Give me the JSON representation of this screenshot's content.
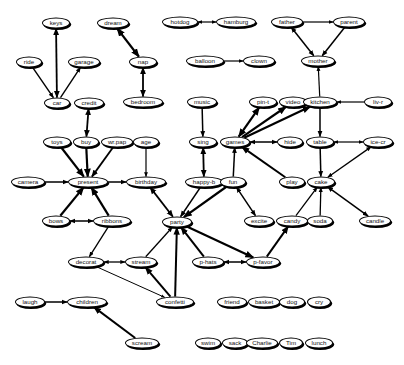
{
  "diagram": {
    "type": "directed-graph",
    "nodes": [
      {
        "id": "keys",
        "label": "keys",
        "x": 56,
        "y": 23,
        "w": 28
      },
      {
        "id": "ride",
        "label": "ride",
        "x": 29,
        "y": 62,
        "w": 26
      },
      {
        "id": "garage",
        "label": "garage",
        "x": 84,
        "y": 62,
        "w": 32
      },
      {
        "id": "car",
        "label": "car",
        "x": 57,
        "y": 103,
        "w": 26
      },
      {
        "id": "credit",
        "label": "credit",
        "x": 89,
        "y": 103,
        "w": 30
      },
      {
        "id": "dream",
        "label": "dream",
        "x": 113,
        "y": 23,
        "w": 32
      },
      {
        "id": "nap",
        "label": "nap",
        "x": 143,
        "y": 62,
        "w": 28
      },
      {
        "id": "bedroom",
        "label": "bedroom",
        "x": 143,
        "y": 102,
        "w": 40
      },
      {
        "id": "hotdog",
        "label": "hotdog",
        "x": 180,
        "y": 22,
        "w": 36
      },
      {
        "id": "hamburg",
        "label": "hamburg",
        "x": 236,
        "y": 22,
        "w": 40
      },
      {
        "id": "balloon",
        "label": "balloon",
        "x": 205,
        "y": 61,
        "w": 38
      },
      {
        "id": "clown",
        "label": "clown",
        "x": 259,
        "y": 61,
        "w": 32
      },
      {
        "id": "father",
        "label": "father",
        "x": 287,
        "y": 22,
        "w": 32
      },
      {
        "id": "parent",
        "label": "parent",
        "x": 349,
        "y": 22,
        "w": 32
      },
      {
        "id": "mother",
        "label": "mother",
        "x": 318,
        "y": 61,
        "w": 34
      },
      {
        "id": "music",
        "label": "music",
        "x": 202,
        "y": 102,
        "w": 30
      },
      {
        "id": "pin-t",
        "label": "pin-t",
        "x": 263,
        "y": 102,
        "w": 28
      },
      {
        "id": "video",
        "label": "video",
        "x": 293,
        "y": 102,
        "w": 28
      },
      {
        "id": "kitchen",
        "label": "kitchen",
        "x": 320,
        "y": 102,
        "w": 34
      },
      {
        "id": "liv-r",
        "label": "liv-r",
        "x": 378,
        "y": 102,
        "w": 28
      },
      {
        "id": "toys",
        "label": "toys",
        "x": 57,
        "y": 142,
        "w": 28
      },
      {
        "id": "buy",
        "label": "buy",
        "x": 86,
        "y": 142,
        "w": 26
      },
      {
        "id": "wr.pap",
        "label": "wr.pap",
        "x": 117,
        "y": 142,
        "w": 32
      },
      {
        "id": "age",
        "label": "age",
        "x": 146,
        "y": 142,
        "w": 26
      },
      {
        "id": "sing",
        "label": "sing",
        "x": 203,
        "y": 142,
        "w": 28
      },
      {
        "id": "games",
        "label": "games",
        "x": 235,
        "y": 142,
        "w": 30
      },
      {
        "id": "hide",
        "label": "hide",
        "x": 290,
        "y": 142,
        "w": 26
      },
      {
        "id": "table",
        "label": "table",
        "x": 320,
        "y": 142,
        "w": 28
      },
      {
        "id": "ice-cr",
        "label": "ice-cr",
        "x": 378,
        "y": 142,
        "w": 30
      },
      {
        "id": "camera",
        "label": "camera",
        "x": 28,
        "y": 182,
        "w": 34
      },
      {
        "id": "present",
        "label": "present",
        "x": 88,
        "y": 182,
        "w": 40
      },
      {
        "id": "birthday",
        "label": "birthday",
        "x": 146,
        "y": 182,
        "w": 40
      },
      {
        "id": "happy-b",
        "label": "happy-b",
        "x": 204,
        "y": 182,
        "w": 38
      },
      {
        "id": "fun",
        "label": "fun",
        "x": 233,
        "y": 182,
        "w": 26
      },
      {
        "id": "play",
        "label": "play",
        "x": 292,
        "y": 182,
        "w": 26
      },
      {
        "id": "cake",
        "label": "cake",
        "x": 321,
        "y": 182,
        "w": 28
      },
      {
        "id": "bows",
        "label": "bows",
        "x": 56,
        "y": 221,
        "w": 28
      },
      {
        "id": "ribbons",
        "label": "ribbons",
        "x": 112,
        "y": 221,
        "w": 38
      },
      {
        "id": "party",
        "label": "party",
        "x": 177,
        "y": 222,
        "w": 30
      },
      {
        "id": "excite",
        "label": "excite",
        "x": 259,
        "y": 221,
        "w": 30
      },
      {
        "id": "candy",
        "label": "candy",
        "x": 292,
        "y": 221,
        "w": 32
      },
      {
        "id": "soda",
        "label": "soda",
        "x": 320,
        "y": 221,
        "w": 26
      },
      {
        "id": "candle",
        "label": "candle",
        "x": 375,
        "y": 221,
        "w": 32
      },
      {
        "id": "decorat",
        "label": "decorat",
        "x": 86,
        "y": 262,
        "w": 36
      },
      {
        "id": "stream",
        "label": "stream",
        "x": 141,
        "y": 262,
        "w": 32
      },
      {
        "id": "p-hats",
        "label": "p-hats",
        "x": 208,
        "y": 262,
        "w": 32
      },
      {
        "id": "p-favor",
        "label": "p-favor",
        "x": 263,
        "y": 262,
        "w": 34
      },
      {
        "id": "laugh",
        "label": "laugh",
        "x": 30,
        "y": 302,
        "w": 30
      },
      {
        "id": "children",
        "label": "children",
        "x": 87,
        "y": 302,
        "w": 40
      },
      {
        "id": "confetti",
        "label": "confetti",
        "x": 175,
        "y": 302,
        "w": 38
      },
      {
        "id": "friend",
        "label": "friend",
        "x": 232,
        "y": 302,
        "w": 30
      },
      {
        "id": "basket",
        "label": "basket",
        "x": 264,
        "y": 302,
        "w": 32
      },
      {
        "id": "dog",
        "label": "dog",
        "x": 292,
        "y": 302,
        "w": 26
      },
      {
        "id": "cry",
        "label": "cry",
        "x": 319,
        "y": 302,
        "w": 24
      },
      {
        "id": "scream",
        "label": "scream",
        "x": 142,
        "y": 343,
        "w": 34
      },
      {
        "id": "swim",
        "label": "swim",
        "x": 208,
        "y": 343,
        "w": 26
      },
      {
        "id": "sack",
        "label": "sack",
        "x": 235,
        "y": 343,
        "w": 26
      },
      {
        "id": "Charlie",
        "label": "Charlie",
        "x": 262,
        "y": 343,
        "w": 32
      },
      {
        "id": "Tim",
        "label": "Tim",
        "x": 291,
        "y": 343,
        "w": 24
      },
      {
        "id": "lunch",
        "label": "lunch",
        "x": 319,
        "y": 343,
        "w": 28
      }
    ],
    "edges": [
      {
        "from": "keys",
        "to": "car",
        "bidir": true,
        "w": 1.8
      },
      {
        "from": "ride",
        "to": "car",
        "bidir": false,
        "w": 1.4
      },
      {
        "from": "car",
        "to": "garage",
        "bidir": false,
        "w": 1.4
      },
      {
        "from": "credit",
        "to": "buy",
        "bidir": true,
        "w": 1.8
      },
      {
        "from": "dream",
        "to": "nap",
        "bidir": true,
        "w": 2.2
      },
      {
        "from": "nap",
        "to": "bedroom",
        "bidir": true,
        "w": 1.8
      },
      {
        "from": "hotdog",
        "to": "hamburg",
        "bidir": true,
        "w": 1.2
      },
      {
        "from": "balloon",
        "to": "clown",
        "bidir": false,
        "w": 1.2
      },
      {
        "from": "father",
        "to": "parent",
        "bidir": false,
        "w": 1.2
      },
      {
        "from": "father",
        "to": "mother",
        "bidir": true,
        "w": 1.5
      },
      {
        "from": "parent",
        "to": "mother",
        "bidir": false,
        "w": 1.5
      },
      {
        "from": "kitchen",
        "to": "mother",
        "bidir": false,
        "w": 1.2
      },
      {
        "from": "liv-r",
        "to": "kitchen",
        "bidir": false,
        "w": 1.2
      },
      {
        "from": "kitchen",
        "to": "table",
        "bidir": false,
        "w": 1.5
      },
      {
        "from": "music",
        "to": "sing",
        "bidir": false,
        "w": 1.5
      },
      {
        "from": "games",
        "to": "pin-t",
        "bidir": true,
        "w": 2.2
      },
      {
        "from": "games",
        "to": "video",
        "bidir": false,
        "w": 2.2
      },
      {
        "from": "games",
        "to": "kitchen",
        "bidir": false,
        "w": 2.2
      },
      {
        "from": "games",
        "to": "hide",
        "bidir": true,
        "w": 1.5
      },
      {
        "from": "table",
        "to": "ice-cr",
        "bidir": true,
        "w": 1.2
      },
      {
        "from": "table",
        "to": "cake",
        "bidir": false,
        "w": 1.5
      },
      {
        "from": "ice-cr",
        "to": "cake",
        "bidir": true,
        "w": 1.3
      },
      {
        "from": "toys",
        "to": "present",
        "bidir": false,
        "w": 2.2
      },
      {
        "from": "buy",
        "to": "present",
        "bidir": false,
        "w": 2.2
      },
      {
        "from": "wr.pap",
        "to": "present",
        "bidir": false,
        "w": 1.8
      },
      {
        "from": "age",
        "to": "birthday",
        "bidir": false,
        "w": 1.2
      },
      {
        "from": "camera",
        "to": "present",
        "bidir": false,
        "w": 1.5
      },
      {
        "from": "present",
        "to": "birthday",
        "bidir": false,
        "w": 1.5
      },
      {
        "from": "sing",
        "to": "happy-b",
        "bidir": true,
        "w": 1.8
      },
      {
        "from": "fun",
        "to": "games",
        "bidir": false,
        "w": 1.5
      },
      {
        "from": "play",
        "to": "games",
        "bidir": false,
        "w": 2.0
      },
      {
        "from": "bows",
        "to": "present",
        "bidir": false,
        "w": 2.2
      },
      {
        "from": "ribbons",
        "to": "present",
        "bidir": false,
        "w": 2.2
      },
      {
        "from": "bows",
        "to": "ribbons",
        "bidir": true,
        "w": 1.5
      },
      {
        "from": "birthday",
        "to": "party",
        "bidir": true,
        "w": 1.8
      },
      {
        "from": "happy-b",
        "to": "party",
        "bidir": false,
        "w": 1.6
      },
      {
        "from": "fun",
        "to": "party",
        "bidir": false,
        "w": 2.2
      },
      {
        "from": "fun",
        "to": "excite",
        "bidir": true,
        "w": 1.5
      },
      {
        "from": "candy",
        "to": "cake",
        "bidir": false,
        "w": 1.3
      },
      {
        "from": "soda",
        "to": "cake",
        "bidir": false,
        "w": 1.3
      },
      {
        "from": "cake",
        "to": "candle",
        "bidir": true,
        "w": 1.5
      },
      {
        "from": "ribbons",
        "to": "decorat",
        "bidir": false,
        "w": 1.3
      },
      {
        "from": "decorat",
        "to": "stream",
        "bidir": true,
        "w": 1.3
      },
      {
        "from": "stream",
        "to": "party",
        "bidir": false,
        "w": 1.3
      },
      {
        "from": "p-hats",
        "to": "party",
        "bidir": false,
        "w": 2.0
      },
      {
        "from": "party",
        "to": "p-favor",
        "bidir": false,
        "w": 2.2
      },
      {
        "from": "p-favor",
        "to": "p-hats",
        "bidir": true,
        "w": 1.5
      },
      {
        "from": "p-favor",
        "to": "candy",
        "bidir": false,
        "w": 2.0
      },
      {
        "from": "confetti",
        "to": "party",
        "bidir": false,
        "w": 2.0
      },
      {
        "from": "confetti",
        "to": "stream",
        "bidir": false,
        "w": 2.0
      },
      {
        "from": "decorat",
        "to": "confetti",
        "bidir": false,
        "w": 1.0
      },
      {
        "from": "laugh",
        "to": "children",
        "bidir": false,
        "w": 1.5
      },
      {
        "from": "scream",
        "to": "children",
        "bidir": false,
        "w": 2.0
      }
    ],
    "colors": {
      "stroke": "#000000",
      "fill": "#ffffff",
      "text": "#111111"
    }
  }
}
